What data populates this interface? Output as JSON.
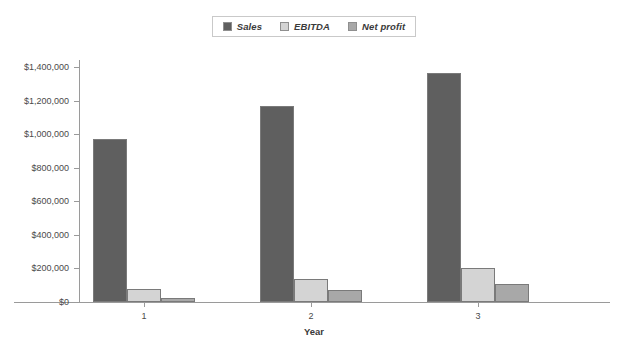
{
  "chart_data": {
    "type": "bar",
    "title": "",
    "xlabel": "Year",
    "ylabel": "",
    "categories": [
      "1",
      "2",
      "3"
    ],
    "series": [
      {
        "name": "Sales",
        "values": [
          970000,
          1165000,
          1365000
        ],
        "color": "#5f5f5f"
      },
      {
        "name": "EBITDA",
        "values": [
          80000,
          140000,
          205000
        ],
        "color": "#d4d4d4"
      },
      {
        "name": "Net profit",
        "values": [
          25000,
          70000,
          105000
        ],
        "color": "#a8a8a8"
      }
    ],
    "ylim": [
      0,
      1400000
    ],
    "y_ticks": [
      0,
      200000,
      400000,
      600000,
      800000,
      1000000,
      1200000,
      1400000
    ],
    "y_tick_labels": [
      "$0",
      "$200,000",
      "$400,000",
      "$600,000",
      "$800,000",
      "$1,000,000",
      "$1,200,000",
      "$1,400,000"
    ],
    "grid": false,
    "legend_position": "top-center",
    "legend_entries": [
      "Sales",
      "EBITDA",
      "Net profit"
    ]
  },
  "legend": {
    "items": [
      {
        "label": "Sales",
        "swatch": "legend-swatch-sales"
      },
      {
        "label": "EBITDA",
        "swatch": "legend-swatch-ebitda"
      },
      {
        "label": "Net profit",
        "swatch": "legend-swatch-net-profit"
      }
    ]
  },
  "axes": {
    "x_title": "Year",
    "x_labels": [
      "1",
      "2",
      "3"
    ],
    "y_labels": [
      "$1,400,000",
      "$1,200,000",
      "$1,000,000",
      "$800,000",
      "$600,000",
      "$400,000",
      "$200,000",
      "$0"
    ]
  },
  "colors": {
    "sales": "#5f5f5f",
    "ebitda": "#d4d4d4",
    "net_profit": "#a8a8a8",
    "axis": "#9a9a9a",
    "text": "#3a3a3a",
    "background": "#ffffff"
  }
}
